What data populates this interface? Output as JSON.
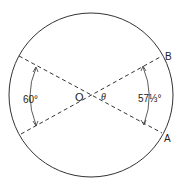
{
  "figure": {
    "type": "circle-radian-diagram",
    "circle": {
      "cx": 91,
      "cy": 95,
      "r": 82,
      "stroke": "#333333"
    },
    "lines": [
      {
        "name": "line-to-A",
        "x1": 19,
        "y1": 56,
        "x2": 162,
        "y2": 133,
        "style": "dashed"
      },
      {
        "name": "line-to-B",
        "x1": 21,
        "y1": 134,
        "x2": 162,
        "y2": 56,
        "style": "dashed"
      }
    ],
    "center_label": "O",
    "angle_label": "θ",
    "point_labels": {
      "A": "A",
      "B": "B"
    },
    "left_arc_label": "60°",
    "right_arc_label": "57⅓°"
  }
}
